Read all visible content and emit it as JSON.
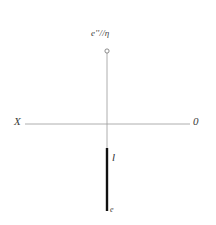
{
  "figure": {
    "background_color": "#ffffff",
    "width": 216,
    "height": 225,
    "labels": {
      "ground_line": "X",
      "origin": "0",
      "projection_top": "e''//η",
      "segment": "l",
      "point_bottom": "e"
    },
    "colors": {
      "thin_line": "#9a9a9a",
      "thick_line": "#111111",
      "marker_stroke": "#6f6f6f",
      "text": "#3a3a3a"
    },
    "geometry": {
      "horizontal_axis": {
        "x1": 25,
        "y1": 124,
        "x2": 190,
        "y2": 124,
        "stroke_width": 0.8
      },
      "vertical_thin_line": {
        "x1": 107,
        "y1": 53,
        "x2": 107,
        "y2": 148,
        "stroke_width": 0.8
      },
      "thick_segment": {
        "x1": 107,
        "y1": 148,
        "x2": 107,
        "y2": 211,
        "stroke_width": 2.4
      },
      "top_circle_marker": {
        "cx": 107,
        "cy": 51,
        "r": 2.1,
        "stroke_width": 0.8
      }
    }
  }
}
